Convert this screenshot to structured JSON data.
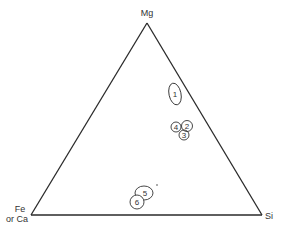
{
  "diagram": {
    "type": "ternary",
    "vertices": {
      "top": "Mg",
      "left_line1": "Fe",
      "left_line2": "or Ca",
      "right": "Si"
    },
    "fields": [
      {
        "id": "1",
        "label": "1"
      },
      {
        "id": "2",
        "label": "2"
      },
      {
        "id": "3",
        "label": "3"
      },
      {
        "id": "4",
        "label": "4"
      },
      {
        "id": "5",
        "label": "5"
      },
      {
        "id": "6",
        "label": "6"
      }
    ]
  }
}
